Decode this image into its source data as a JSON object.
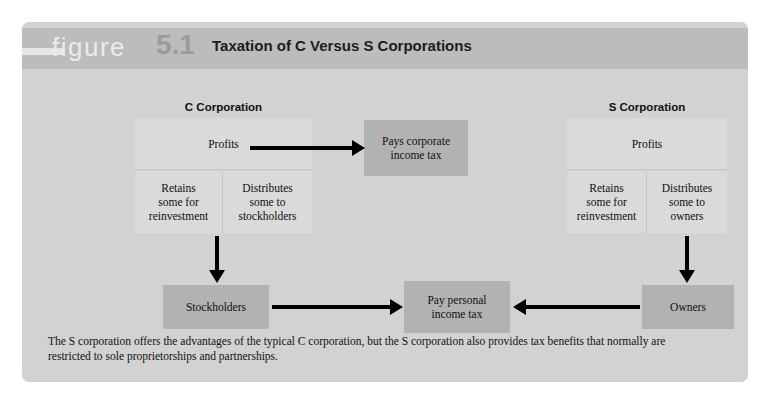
{
  "figure": {
    "word": "figure",
    "number": "5.1",
    "title": "Taxation of C Versus S Corporations"
  },
  "columns": {
    "c_label": "C Corporation",
    "s_label": "S Corporation"
  },
  "boxes": {
    "c_profits": "Profits",
    "c_retains": "Retains\nsome for\nreinvestment",
    "c_distributes": "Distributes\nsome to\nstockholders",
    "s_profits": "Profits",
    "s_retains": "Retains\nsome for\nreinvestment",
    "s_distributes": "Distributes\nsome to\nowners",
    "pays_corporate": "Pays corporate\nincome tax",
    "stockholders": "Stockholders",
    "pay_personal": "Pay personal\nincome tax",
    "owners": "Owners"
  },
  "caption": "The S corporation offers the advantages of the typical C corporation, but the S corporation also provides tax benefits that normally are restricted to sole proprietorships and partnerships.",
  "colors": {
    "panel_bg": "#d2d2d2",
    "header_bg": "#bcbcbc",
    "box_light": "#dadada",
    "box_dark": "#b2b2b2",
    "arrow": "#000000",
    "figure_number": "#9b9b9b"
  },
  "flow": {
    "edges": [
      {
        "from": "c_profits",
        "to": "pays_corporate",
        "direction": "right"
      },
      {
        "from": "c_distributes",
        "to": "stockholders",
        "direction": "down"
      },
      {
        "from": "stockholders",
        "to": "pay_personal",
        "direction": "right"
      },
      {
        "from": "owners",
        "to": "pay_personal",
        "direction": "left"
      },
      {
        "from": "s_distributes",
        "to": "owners",
        "direction": "down"
      }
    ]
  }
}
